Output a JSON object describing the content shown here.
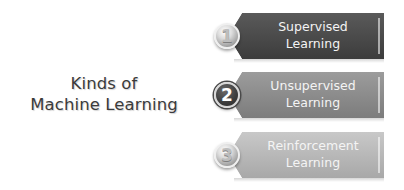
{
  "title": {
    "line1": "Kinds of",
    "line2": "Machine Learning",
    "color": "#3b3b3b"
  },
  "items": [
    {
      "number": "1",
      "line1": "Supervised",
      "line2": "Learning",
      "banner_color_top": "#565656",
      "banner_color_bottom": "#3e3e3e",
      "badge_style": "silver"
    },
    {
      "number": "2",
      "line1": "Unsupervised",
      "line2": "Learning",
      "banner_color_top": "#999999",
      "banner_color_bottom": "#7f7f7f",
      "badge_style": "dark"
    },
    {
      "number": "3",
      "line1": "Reinforcement",
      "line2": "Learning",
      "banner_color_top": "#c4c4c4",
      "banner_color_bottom": "#a9a9a9",
      "badge_style": "silver"
    }
  ]
}
